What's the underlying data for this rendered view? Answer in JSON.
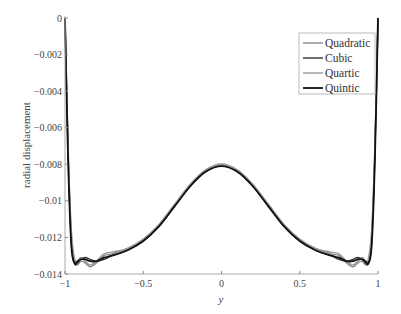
{
  "chart_data": {
    "type": "line",
    "title": "",
    "xlabel": "y",
    "ylabel": "radial displacement",
    "xlim": [
      -1,
      1
    ],
    "ylim": [
      -0.014,
      0
    ],
    "grid": false,
    "legend_position": "upper right",
    "xticks": [
      -1,
      -0.5,
      0,
      0.5,
      1
    ],
    "xtick_labels": [
      "-1",
      "-0.5",
      "0",
      "0.5",
      "1"
    ],
    "yticks": [
      0,
      -0.002,
      -0.004,
      -0.006,
      -0.008,
      -0.01,
      -0.012,
      -0.014
    ],
    "ytick_labels": [
      "0",
      "-0.002",
      "-0.004",
      "-0.006",
      "-0.008",
      "-0.01",
      "-0.012",
      "-0.014"
    ],
    "x": [
      -1,
      -0.98,
      -0.96,
      -0.94,
      -0.92,
      -0.9,
      -0.87,
      -0.84,
      -0.8,
      -0.75,
      -0.7,
      -0.6,
      -0.5,
      -0.4,
      -0.3,
      -0.2,
      -0.1,
      0,
      0.1,
      0.2,
      0.3,
      0.4,
      0.5,
      0.6,
      0.7,
      0.75,
      0.8,
      0.84,
      0.87,
      0.9,
      0.92,
      0.94,
      0.96,
      0.98,
      1
    ],
    "series": [
      {
        "name": "Quadratic",
        "color": "#888888",
        "width": 1.4,
        "values": [
          0,
          -0.0072,
          -0.0118,
          -0.0133,
          -0.0135,
          -0.0133,
          -0.0134,
          -0.0136,
          -0.0134,
          -0.013,
          -0.0129,
          -0.0126,
          -0.0121,
          -0.0113,
          -0.0102,
          -0.0091,
          -0.0083,
          -0.008,
          -0.0083,
          -0.0091,
          -0.0102,
          -0.0113,
          -0.0121,
          -0.0126,
          -0.0129,
          -0.013,
          -0.0134,
          -0.0136,
          -0.0134,
          -0.0133,
          -0.0135,
          -0.0133,
          -0.0118,
          -0.0072,
          0
        ]
      },
      {
        "name": "Cubic",
        "color": "#333333",
        "width": 1.4,
        "values": [
          0,
          -0.0075,
          -0.0122,
          -0.0134,
          -0.0134,
          -0.0132,
          -0.0131,
          -0.0132,
          -0.0133,
          -0.0132,
          -0.013,
          -0.0127,
          -0.0122,
          -0.0114,
          -0.0103,
          -0.0092,
          -0.0084,
          -0.0081,
          -0.0084,
          -0.0092,
          -0.0103,
          -0.0114,
          -0.0122,
          -0.0127,
          -0.013,
          -0.0132,
          -0.0133,
          -0.0132,
          -0.0131,
          -0.0132,
          -0.0134,
          -0.0134,
          -0.0122,
          -0.0075,
          0
        ]
      },
      {
        "name": "Quartic",
        "color": "#999999",
        "width": 1.4,
        "values": [
          0,
          -0.007,
          -0.0115,
          -0.0131,
          -0.0133,
          -0.0131,
          -0.0133,
          -0.0135,
          -0.0133,
          -0.0129,
          -0.0128,
          -0.0126,
          -0.0121,
          -0.0113,
          -0.0102,
          -0.0091,
          -0.0083,
          -0.008,
          -0.0083,
          -0.0091,
          -0.0102,
          -0.0113,
          -0.0121,
          -0.0126,
          -0.0128,
          -0.0129,
          -0.0133,
          -0.0135,
          -0.0133,
          -0.0131,
          -0.0133,
          -0.0131,
          -0.0115,
          -0.007,
          0
        ]
      },
      {
        "name": "Quintic",
        "color": "#111111",
        "width": 1.8,
        "values": [
          0,
          -0.0078,
          -0.0124,
          -0.0134,
          -0.0133,
          -0.0132,
          -0.0132,
          -0.0133,
          -0.0133,
          -0.0131,
          -0.013,
          -0.0127,
          -0.0122,
          -0.0114,
          -0.0103,
          -0.0092,
          -0.0084,
          -0.0081,
          -0.0084,
          -0.0092,
          -0.0103,
          -0.0114,
          -0.0122,
          -0.0127,
          -0.013,
          -0.0131,
          -0.0133,
          -0.0133,
          -0.0132,
          -0.0132,
          -0.0133,
          -0.0134,
          -0.0124,
          -0.0078,
          0
        ]
      }
    ]
  }
}
